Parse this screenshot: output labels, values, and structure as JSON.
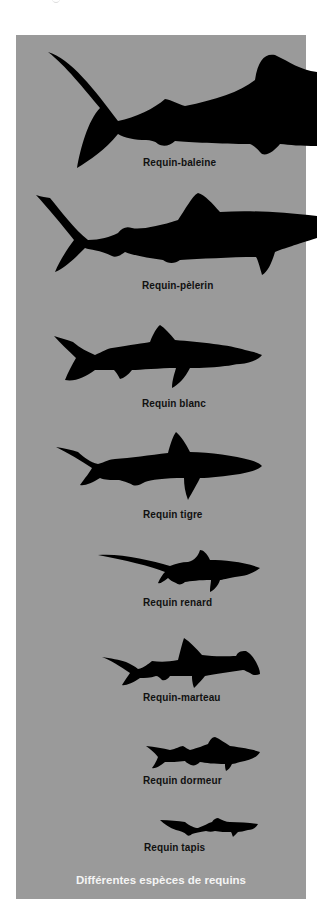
{
  "figure": {
    "title": "Différentes espèces de requins",
    "background_color": "#9a9a9a",
    "silhouette_color": "#000000",
    "species": [
      {
        "id": "whale",
        "label": "Requin-baleine"
      },
      {
        "id": "basking",
        "label": "Requin-pèlerin"
      },
      {
        "id": "white",
        "label": "Requin blanc"
      },
      {
        "id": "tiger",
        "label": "Requin tigre"
      },
      {
        "id": "thresher",
        "label": "Requin renard"
      },
      {
        "id": "hammerhead",
        "label": "Requin-marteau"
      },
      {
        "id": "nurse",
        "label": "Requin dormeur"
      },
      {
        "id": "wobbegong",
        "label": "Requin tapis"
      }
    ]
  }
}
